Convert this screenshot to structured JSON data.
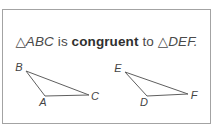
{
  "card": {
    "statement": {
      "subject": "△ABC",
      "verb": "is",
      "keyword": "congruent",
      "preposition": "to",
      "object": "△DEF."
    },
    "figures": {
      "triangle_abc": {
        "points": "26,71 45,96 89,95",
        "labels": {
          "b": "B",
          "a": "A",
          "c": "C"
        }
      },
      "triangle_def": {
        "points": "125,72 147,96 188,94",
        "labels": {
          "e": "E",
          "d": "D",
          "f": "F"
        }
      }
    },
    "colors": {
      "border": "#a3a3a3",
      "triangle_line": "#5f5f5f",
      "text": "#4a4a4a",
      "bold_text": "#2f2f2f",
      "background": "#ffffff"
    }
  }
}
